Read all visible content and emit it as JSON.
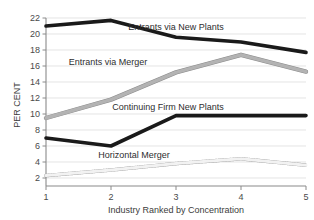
{
  "chart_data": {
    "type": "line",
    "title": "",
    "xlabel": "Industry Ranked by Concentration",
    "ylabel": "PER CENT",
    "x": [
      1,
      2,
      3,
      4,
      5
    ],
    "xtick_labels": [
      "1",
      "2",
      "3",
      "4",
      "5"
    ],
    "ytick_labels": [
      "2",
      "4",
      "6",
      "8",
      "10",
      "12",
      "14",
      "16",
      "18",
      "20",
      "22"
    ],
    "ytick_values": [
      2,
      4,
      6,
      8,
      10,
      12,
      14,
      16,
      18,
      20,
      22
    ],
    "xlim": [
      1,
      5
    ],
    "ylim": [
      1,
      22
    ],
    "grid": "horizontal",
    "legend_position": "inline-labels",
    "series": [
      {
        "name": "Entrants via New Plants",
        "values": [
          21.0,
          21.7,
          19.6,
          19.0,
          17.7
        ],
        "style": "thick-black",
        "color": "#1a1a1a"
      },
      {
        "name": "Entrants via Merger",
        "values": [
          9.5,
          11.8,
          15.2,
          17.4,
          15.3
        ],
        "style": "thick-gray",
        "color": "#b3b3b3"
      },
      {
        "name": "Continuing Firm New Plants",
        "values": [
          7.0,
          6.0,
          9.8,
          9.8,
          9.8
        ],
        "style": "thick-black",
        "color": "#1a1a1a"
      },
      {
        "name": "Horizontal Merger",
        "values": [
          2.3,
          3.0,
          3.8,
          4.4,
          3.6
        ],
        "style": "dotted-outline",
        "color": "#9a9a9a"
      }
    ],
    "inline_labels": [
      {
        "text": "Entrants via New Plants",
        "x": 176,
        "y": 30
      },
      {
        "text": "Entrants via Merger",
        "x": 108,
        "y": 65
      },
      {
        "text": "Continuing Firm New Plants",
        "x": 168,
        "y": 110
      },
      {
        "text": "Horizontal Merger",
        "x": 134,
        "y": 158
      }
    ]
  }
}
